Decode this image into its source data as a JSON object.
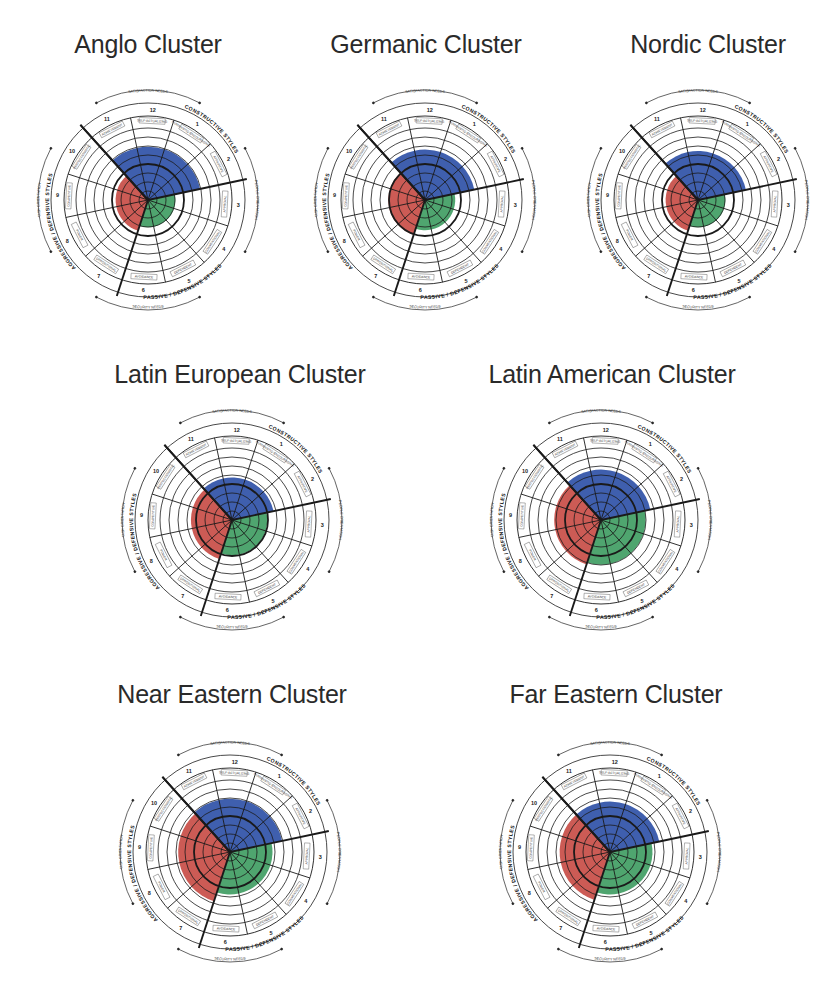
{
  "figure": {
    "background": "#ffffff"
  },
  "colors": {
    "constructive": "#3f5fae",
    "aggressive_defensive": "#cc5b55",
    "passive_defensive": "#4fa56f",
    "grid": "#1a1a1a"
  },
  "circumplex_labels": {
    "sector_numbers": [
      "1",
      "2",
      "3",
      "4",
      "5",
      "6",
      "7",
      "8",
      "9",
      "10",
      "11",
      "12"
    ],
    "sector_styles": [
      "HUMANISTIC-ENCOURAGING",
      "AFFILIATIVE",
      "APPROVAL",
      "CONVENTIONAL",
      "DEPENDENT",
      "AVOIDANCE",
      "OPPOSITIONAL",
      "POWER",
      "COMPETITIVE",
      "PERFECTIONISTIC",
      "ACHIEVEMENT",
      "SELF-ACTUALIZING"
    ],
    "cluster_constructive": "CONSTRUCTIVE STYLES",
    "cluster_passive": "PASSIVE / DEFENSIVE STYLES",
    "cluster_aggressive": "AGGRESSIVE / DEFENSIVE STYLES",
    "top_arrow": "SATISFACTION NEEDS",
    "bottom_arrow": "SECURITY NEEDS",
    "left_arrow": "TASK ORIENTATION",
    "right_arrow": "PEOPLE ORIENTATION"
  },
  "panels": [
    {
      "title": "Anglo Cluster",
      "cx": 148,
      "cy": 200,
      "title_x": 148,
      "title_y": 30
    },
    {
      "title": "Germanic Cluster",
      "cx": 425,
      "cy": 200,
      "title_x": 426,
      "title_y": 30
    },
    {
      "title": "Nordic Cluster",
      "cx": 698,
      "cy": 200,
      "title_x": 708,
      "title_y": 30
    },
    {
      "title": "Latin European Cluster",
      "cx": 232,
      "cy": 520,
      "title_x": 240,
      "title_y": 360
    },
    {
      "title": "Latin American Cluster",
      "cx": 601,
      "cy": 520,
      "title_x": 612,
      "title_y": 360
    },
    {
      "title": "Near Eastern Cluster",
      "cx": 230,
      "cy": 852,
      "title_x": 232,
      "title_y": 680
    },
    {
      "title": "Far Eastern Cluster",
      "cx": 610,
      "cy": 852,
      "title_x": 616,
      "title_y": 680
    }
  ],
  "chart_data": {
    "type": "polar-area (circumplex)",
    "scale": "percentile, 0 at center to 100 at outer plotting ring (estimated from fill radius)",
    "categories": [
      "Anglo Cluster",
      "Germanic Cluster",
      "Nordic Cluster",
      "Latin European Cluster",
      "Latin American Cluster",
      "Near Eastern Cluster",
      "Far Eastern Cluster"
    ],
    "sector_layout": {
      "sectors": [
        "12 Self-Actualizing",
        "1 Humanistic-Encouraging",
        "2 Affiliative",
        "3 Approval",
        "4 Conventional",
        "5 Dependent",
        "6 Avoidance",
        "7 Oppositional",
        "8 Power",
        "9 Competitive",
        "10 Perfectionistic",
        "11 Achievement"
      ],
      "clusters": {
        "Constructive Styles": [
          "11",
          "12",
          "1",
          "2"
        ],
        "Passive/Defensive Styles": [
          "3",
          "4",
          "5",
          "6"
        ],
        "Aggressive/Defensive Styles": [
          "7",
          "8",
          "9",
          "10"
        ]
      },
      "grid_rings": 8,
      "bold_ring_percentile": 50
    },
    "series": [
      {
        "name": "Constructive Styles",
        "color": "#3f5fae",
        "values": [
          74,
          70,
          68,
          59,
          70,
          74,
          70
        ]
      },
      {
        "name": "Passive/Defensive Styles",
        "color": "#4fa56f",
        "values": [
          38,
          42,
          38,
          49,
          62,
          59,
          59
        ]
      },
      {
        "name": "Aggressive/Defensive Styles",
        "color": "#cc5b55",
        "values": [
          45,
          51,
          45,
          57,
          65,
          72,
          70
        ]
      }
    ],
    "ylim": [
      0,
      100
    ],
    "legend": "none (cluster labels around each circumplex)"
  }
}
